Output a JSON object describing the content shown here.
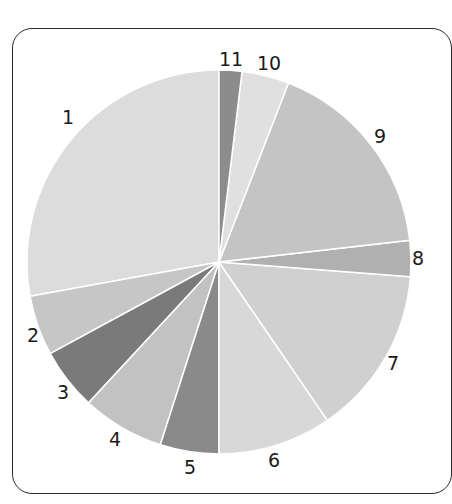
{
  "chart_data": {
    "type": "pie",
    "title": "",
    "start_angle_deg": 0,
    "direction": "counterclockwise-labels-from-left",
    "center": [
      219,
      262
    ],
    "radius": 192,
    "slices": [
      {
        "label": "1",
        "value": 27.9,
        "start": 259.7,
        "end": 360.0,
        "color": "#dcdcdc",
        "label_pos": [
          68,
          124
        ]
      },
      {
        "label": "2",
        "value": 5.1,
        "start": 241.5,
        "end": 259.7,
        "color": "#c6c6c6",
        "label_pos": [
          33,
          342
        ]
      },
      {
        "label": "3",
        "value": 5.2,
        "start": 222.8,
        "end": 241.5,
        "color": "#7a7a7a",
        "label_pos": [
          63,
          399
        ]
      },
      {
        "label": "4",
        "value": 6.9,
        "start": 197.8,
        "end": 222.8,
        "color": "#c2c2c2",
        "label_pos": [
          115,
          446
        ]
      },
      {
        "label": "5",
        "value": 4.9,
        "start": 180.0,
        "end": 197.8,
        "color": "#8a8a8a",
        "label_pos": [
          190,
          474
        ]
      },
      {
        "label": "6",
        "value": 9.5,
        "start": 145.6,
        "end": 180.0,
        "color": "#d8d8d8",
        "label_pos": [
          274,
          467
        ]
      },
      {
        "label": "7",
        "value": 14.2,
        "start": 94.4,
        "end": 145.6,
        "color": "#d0d0d0",
        "label_pos": [
          393,
          370
        ]
      },
      {
        "label": "8",
        "value": 3.0,
        "start": 83.5,
        "end": 94.4,
        "color": "#b0b0b0",
        "label_pos": [
          418,
          265
        ]
      },
      {
        "label": "9",
        "value": 17.3,
        "start": 21.2,
        "end": 83.5,
        "color": "#c4c4c4",
        "label_pos": [
          380,
          143
        ]
      },
      {
        "label": "10",
        "value": 4.0,
        "start": 6.9,
        "end": 21.2,
        "color": "#e0e0e0",
        "label_pos": [
          269,
          70
        ]
      },
      {
        "label": "11",
        "value": 1.9,
        "start": 0.0,
        "end": 6.9,
        "color": "#8c8c8c",
        "label_pos": [
          231,
          66
        ]
      }
    ],
    "legend": "none",
    "separator_color": "#ffffff"
  }
}
